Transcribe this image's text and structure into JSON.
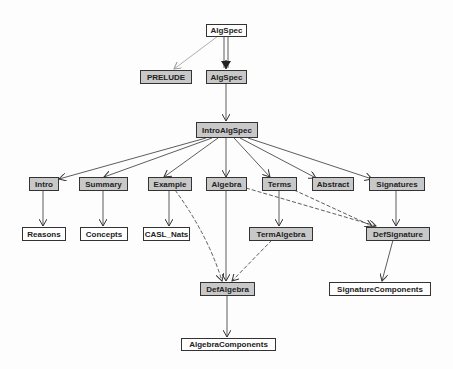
{
  "diagram": {
    "type": "dependency-graph",
    "colors": {
      "shaded_node": "#c8c8c8",
      "plain_node": "#ffffff",
      "edge": "#333333",
      "prelude_edge": "#999999"
    },
    "nodes": {
      "algspec_top": {
        "label": "AlgSpec",
        "shaded": false
      },
      "prelude": {
        "label": "PRELUDE",
        "shaded": true
      },
      "algspec": {
        "label": "AlgSpec",
        "shaded": true
      },
      "introalgspec": {
        "label": "IntroAlgSpec",
        "shaded": true
      },
      "intro": {
        "label": "Intro",
        "shaded": true
      },
      "summary": {
        "label": "Summary",
        "shaded": true
      },
      "example": {
        "label": "Example",
        "shaded": true
      },
      "algebra": {
        "label": "Algebra",
        "shaded": true
      },
      "terms": {
        "label": "Terms",
        "shaded": true
      },
      "abstract": {
        "label": "Abstract",
        "shaded": true
      },
      "signatures": {
        "label": "Signatures",
        "shaded": true
      },
      "reasons": {
        "label": "Reasons",
        "shaded": false
      },
      "concepts": {
        "label": "Concepts",
        "shaded": false
      },
      "casl_nats": {
        "label": "CASL_Nats",
        "shaded": false
      },
      "termalgebra": {
        "label": "TermAlgebra",
        "shaded": true
      },
      "defsignature": {
        "label": "DefSignature",
        "shaded": true
      },
      "defalgebra": {
        "label": "DefAlgebra",
        "shaded": true
      },
      "signaturecomponents": {
        "label": "SignatureComponents",
        "shaded": false
      },
      "algebracomponents": {
        "label": "AlgebraComponents",
        "shaded": false
      }
    },
    "edges": [
      {
        "from": "AlgSpec",
        "to": "PRELUDE",
        "style": "thin-gray"
      },
      {
        "from": "AlgSpec",
        "to": "AlgSpec",
        "style": "double"
      },
      {
        "from": "AlgSpec",
        "to": "IntroAlgSpec",
        "style": "solid"
      },
      {
        "from": "IntroAlgSpec",
        "to": "Intro",
        "style": "solid"
      },
      {
        "from": "IntroAlgSpec",
        "to": "Summary",
        "style": "solid"
      },
      {
        "from": "IntroAlgSpec",
        "to": "Example",
        "style": "solid"
      },
      {
        "from": "IntroAlgSpec",
        "to": "Algebra",
        "style": "solid"
      },
      {
        "from": "IntroAlgSpec",
        "to": "Terms",
        "style": "solid"
      },
      {
        "from": "IntroAlgSpec",
        "to": "Abstract",
        "style": "solid"
      },
      {
        "from": "IntroAlgSpec",
        "to": "Signatures",
        "style": "solid"
      },
      {
        "from": "Intro",
        "to": "Reasons",
        "style": "solid"
      },
      {
        "from": "Summary",
        "to": "Concepts",
        "style": "solid"
      },
      {
        "from": "Example",
        "to": "CASL_Nats",
        "style": "solid"
      },
      {
        "from": "Terms",
        "to": "TermAlgebra",
        "style": "solid"
      },
      {
        "from": "Signatures",
        "to": "DefSignature",
        "style": "solid"
      },
      {
        "from": "Algebra",
        "to": "DefSignature",
        "style": "dashed"
      },
      {
        "from": "Terms",
        "to": "DefSignature",
        "style": "dashed"
      },
      {
        "from": "Example",
        "to": "DefAlgebra",
        "style": "dashed"
      },
      {
        "from": "TermAlgebra",
        "to": "DefAlgebra",
        "style": "dashed"
      },
      {
        "from": "Algebra",
        "to": "DefAlgebra",
        "style": "solid"
      },
      {
        "from": "DefSignature",
        "to": "SignatureComponents",
        "style": "solid"
      },
      {
        "from": "DefAlgebra",
        "to": "AlgebraComponents",
        "style": "solid"
      }
    ]
  }
}
